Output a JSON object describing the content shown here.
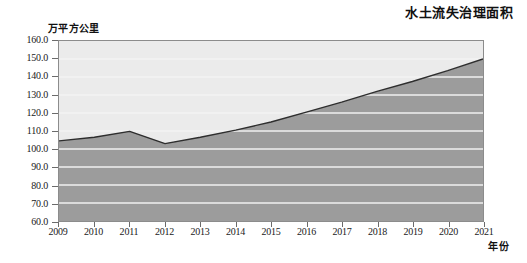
{
  "chart_data": {
    "type": "area",
    "title": "水土流失治理面积",
    "xlabel": "年份",
    "ylabel": "万平方公里",
    "categories": [
      "2009",
      "2010",
      "2011",
      "2012",
      "2013",
      "2014",
      "2015",
      "2016",
      "2017",
      "2018",
      "2019",
      "2020",
      "2021"
    ],
    "values": [
      104.5,
      106.5,
      109.8,
      103.0,
      106.5,
      110.5,
      115.0,
      120.5,
      126.0,
      132.0,
      137.5,
      143.5,
      150.0
    ],
    "x": [
      2009,
      2010,
      2011,
      2012,
      2013,
      2014,
      2015,
      2016,
      2017,
      2018,
      2019,
      2020,
      2021
    ],
    "ylim": [
      60.0,
      160.0
    ],
    "ytick_step": 10.0,
    "yticks": [
      "160.0",
      "150.0",
      "140.0",
      "130.0",
      "120.0",
      "110.0",
      "100.0",
      "90.0",
      "80.0",
      "70.0",
      "60.0"
    ],
    "ytick_values": [
      160.0,
      150.0,
      140.0,
      130.0,
      120.0,
      110.0,
      100.0,
      90.0,
      80.0,
      70.0,
      60.0
    ],
    "grid": true,
    "legend": "none",
    "series": [
      {
        "name": "水土流失治理面积",
        "values": [
          104.5,
          106.5,
          109.8,
          103.0,
          106.5,
          110.5,
          115.0,
          120.5,
          126.0,
          132.0,
          137.5,
          143.5,
          150.0
        ]
      }
    ],
    "colors": {
      "area_fill": "#9c9c9c",
      "above_area": "#ebebeb",
      "line": "#2e2e2e",
      "grid": "#f2f2f2",
      "frame": "#8c8c8c",
      "text": "#1a1a1a"
    }
  }
}
